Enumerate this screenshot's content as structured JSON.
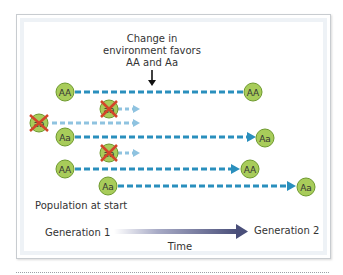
{
  "annotation": {
    "lines": [
      "Change in",
      "environment favors",
      "AA and Aa"
    ]
  },
  "individuals": [
    {
      "genotype": "AA",
      "eliminated": false,
      "survives": true,
      "result": "AA"
    },
    {
      "genotype": "aa",
      "eliminated": true,
      "survives": false
    },
    {
      "genotype": "aa",
      "eliminated": true,
      "survives": false
    },
    {
      "genotype": "Aa",
      "eliminated": false,
      "survives": true,
      "result": "Aa"
    },
    {
      "genotype": "aa",
      "eliminated": true,
      "survives": false
    },
    {
      "genotype": "AA",
      "eliminated": false,
      "survives": true,
      "result": "AA"
    },
    {
      "genotype": "Aa",
      "eliminated": false,
      "survives": true,
      "result": "Aa"
    }
  ],
  "labels": {
    "population": "Population at start",
    "generation1": "Generation 1",
    "generation2": "Generation 2",
    "time": "Time"
  },
  "colors": {
    "circle_fill": "#a8cc5a",
    "circle_stroke": "#6e9a2e",
    "survivor_arrow": "#2a8fbd",
    "eliminated_arrow": "#8fc3e0",
    "cross": "#d2452a",
    "time_arrow": "#4a4f7a"
  }
}
